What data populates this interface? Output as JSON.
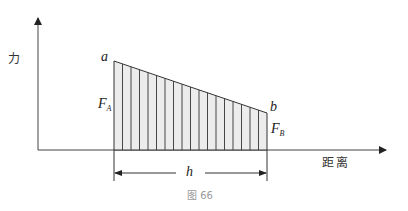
{
  "figure": {
    "caption": "图 66",
    "y_axis_label": "力",
    "x_axis_label": "距离",
    "point_a_label": "a",
    "point_b_label": "b",
    "force_a": {
      "symbol": "F",
      "subscript": "A"
    },
    "force_b": {
      "symbol": "F",
      "subscript": "B"
    },
    "width_label": "h",
    "hatch_line_count": 18,
    "colors": {
      "line": "#333333",
      "fill": "#ececec",
      "caption": "#9a9a9a"
    }
  }
}
